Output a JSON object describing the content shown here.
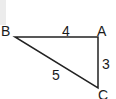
{
  "diagram": {
    "type": "right-triangle",
    "vertices": [
      {
        "name": "A",
        "x": 98,
        "y": 37
      },
      {
        "name": "B",
        "x": 15,
        "y": 37
      },
      {
        "name": "C",
        "x": 98,
        "y": 88
      }
    ],
    "edges": [
      {
        "from": "B",
        "to": "A",
        "length_label": "4"
      },
      {
        "from": "A",
        "to": "C",
        "length_label": "3"
      },
      {
        "from": "B",
        "to": "C",
        "length_label": "5"
      }
    ],
    "labels": {
      "vertex_a": "A",
      "vertex_b": "B",
      "vertex_c": "C",
      "side_ba": "4",
      "side_ac": "3",
      "side_bc": "5"
    },
    "stroke_color": "#222222"
  }
}
